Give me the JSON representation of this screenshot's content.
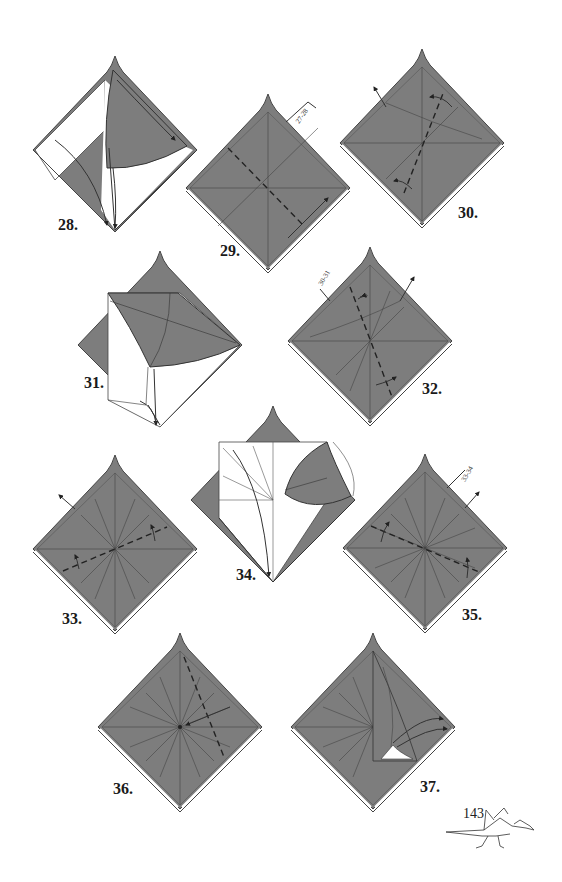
{
  "page": {
    "page_number": "143",
    "paper_color": "#7a7a7a",
    "line_color": "#333333",
    "background": "#ffffff"
  },
  "steps": [
    {
      "number": "28.",
      "type": "fold-flap-down"
    },
    {
      "number": "29.",
      "type": "valley-fold",
      "reference": "27-28"
    },
    {
      "number": "30.",
      "type": "valley-fold"
    },
    {
      "number": "31.",
      "type": "fold-flap-down"
    },
    {
      "number": "32.",
      "type": "valley-fold",
      "reference": "30-31"
    },
    {
      "number": "33.",
      "type": "valley-fold"
    },
    {
      "number": "34.",
      "type": "fold-flap-down"
    },
    {
      "number": "35.",
      "type": "valley-fold",
      "reference": "33-34"
    },
    {
      "number": "36.",
      "type": "valley-fold"
    },
    {
      "number": "37.",
      "type": "squash-fold"
    }
  ]
}
